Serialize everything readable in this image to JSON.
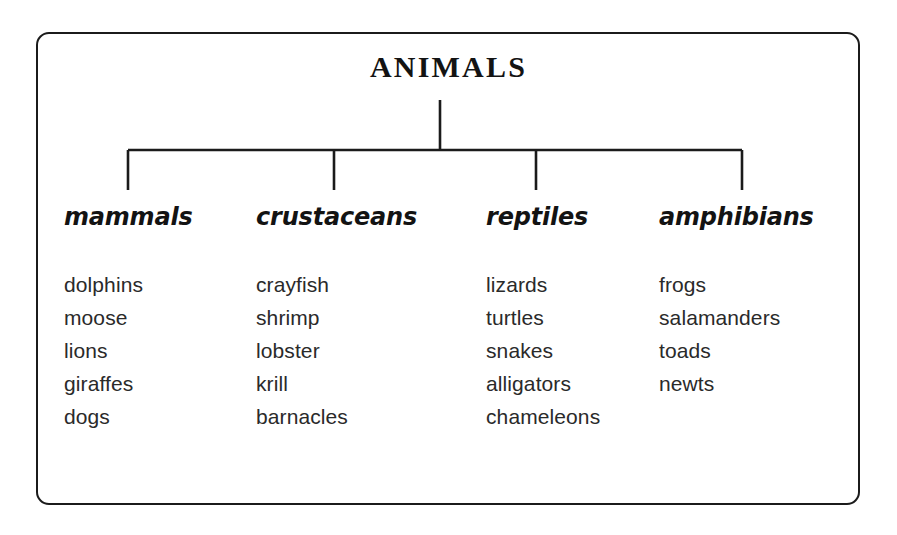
{
  "diagram": {
    "title": "ANIMALS",
    "type": "tree-classification-chart",
    "line_color": "#1b1b1b",
    "text_color": "#131313",
    "background": "#ffffff",
    "columns": [
      {
        "header": "mammals",
        "items": [
          "dolphins",
          "moose",
          "lions",
          "giraffes",
          "dogs"
        ]
      },
      {
        "header": "crustaceans",
        "items": [
          "crayfish",
          "shrimp",
          "lobster",
          "krill",
          "barnacles"
        ]
      },
      {
        "header": "reptiles",
        "items": [
          "lizards",
          "turtles",
          "snakes",
          "alligators",
          "chameleons"
        ]
      },
      {
        "header": "amphibians",
        "items": [
          "frogs",
          "salamanders",
          "toads",
          "newts"
        ]
      }
    ]
  }
}
